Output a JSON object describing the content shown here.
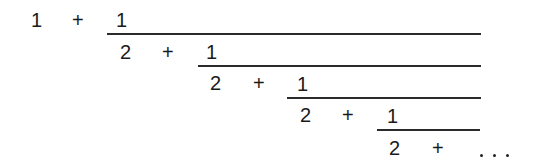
{
  "expression": {
    "description": "Continued fraction",
    "leading": {
      "term": "1",
      "op": "+"
    },
    "levels": [
      {
        "numerator": "1",
        "denominator_term": "2",
        "op": "+"
      },
      {
        "numerator": "1",
        "denominator_term": "2",
        "op": "+"
      },
      {
        "numerator": "1",
        "denominator_term": "2",
        "op": "+"
      },
      {
        "numerator": "1",
        "denominator_term": "2",
        "op": "+"
      }
    ],
    "ellipsis": "..."
  }
}
